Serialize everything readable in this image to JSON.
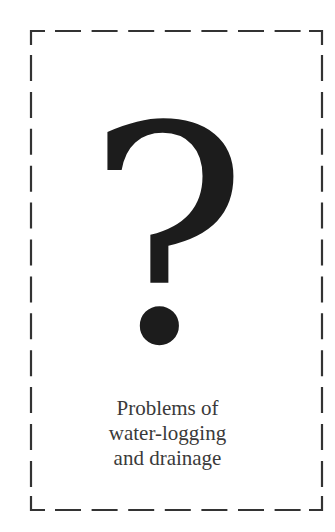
{
  "card": {
    "symbol": "?",
    "symbol_icon": "question-mark-icon",
    "caption_lines": [
      "Problems of",
      "water-logging",
      "and drainage"
    ],
    "border_style": "dashed",
    "border_color": "#333333",
    "text_color": "#3a3a3a",
    "symbol_color": "#1c1c1c"
  }
}
